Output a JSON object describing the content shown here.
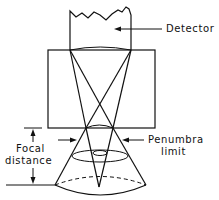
{
  "diagram": {
    "labels": {
      "detector": "Detector",
      "penumbra_line1": "Penumbra",
      "penumbra_line2": "limit",
      "focal_line1": "Focal",
      "focal_line2": "distance"
    },
    "components": [
      "detector",
      "collimator-block",
      "focusing-cone",
      "penumbra-limit-arrows",
      "focal-distance-dimension"
    ],
    "colors": {
      "stroke": "#111111",
      "background": "#ffffff"
    }
  }
}
